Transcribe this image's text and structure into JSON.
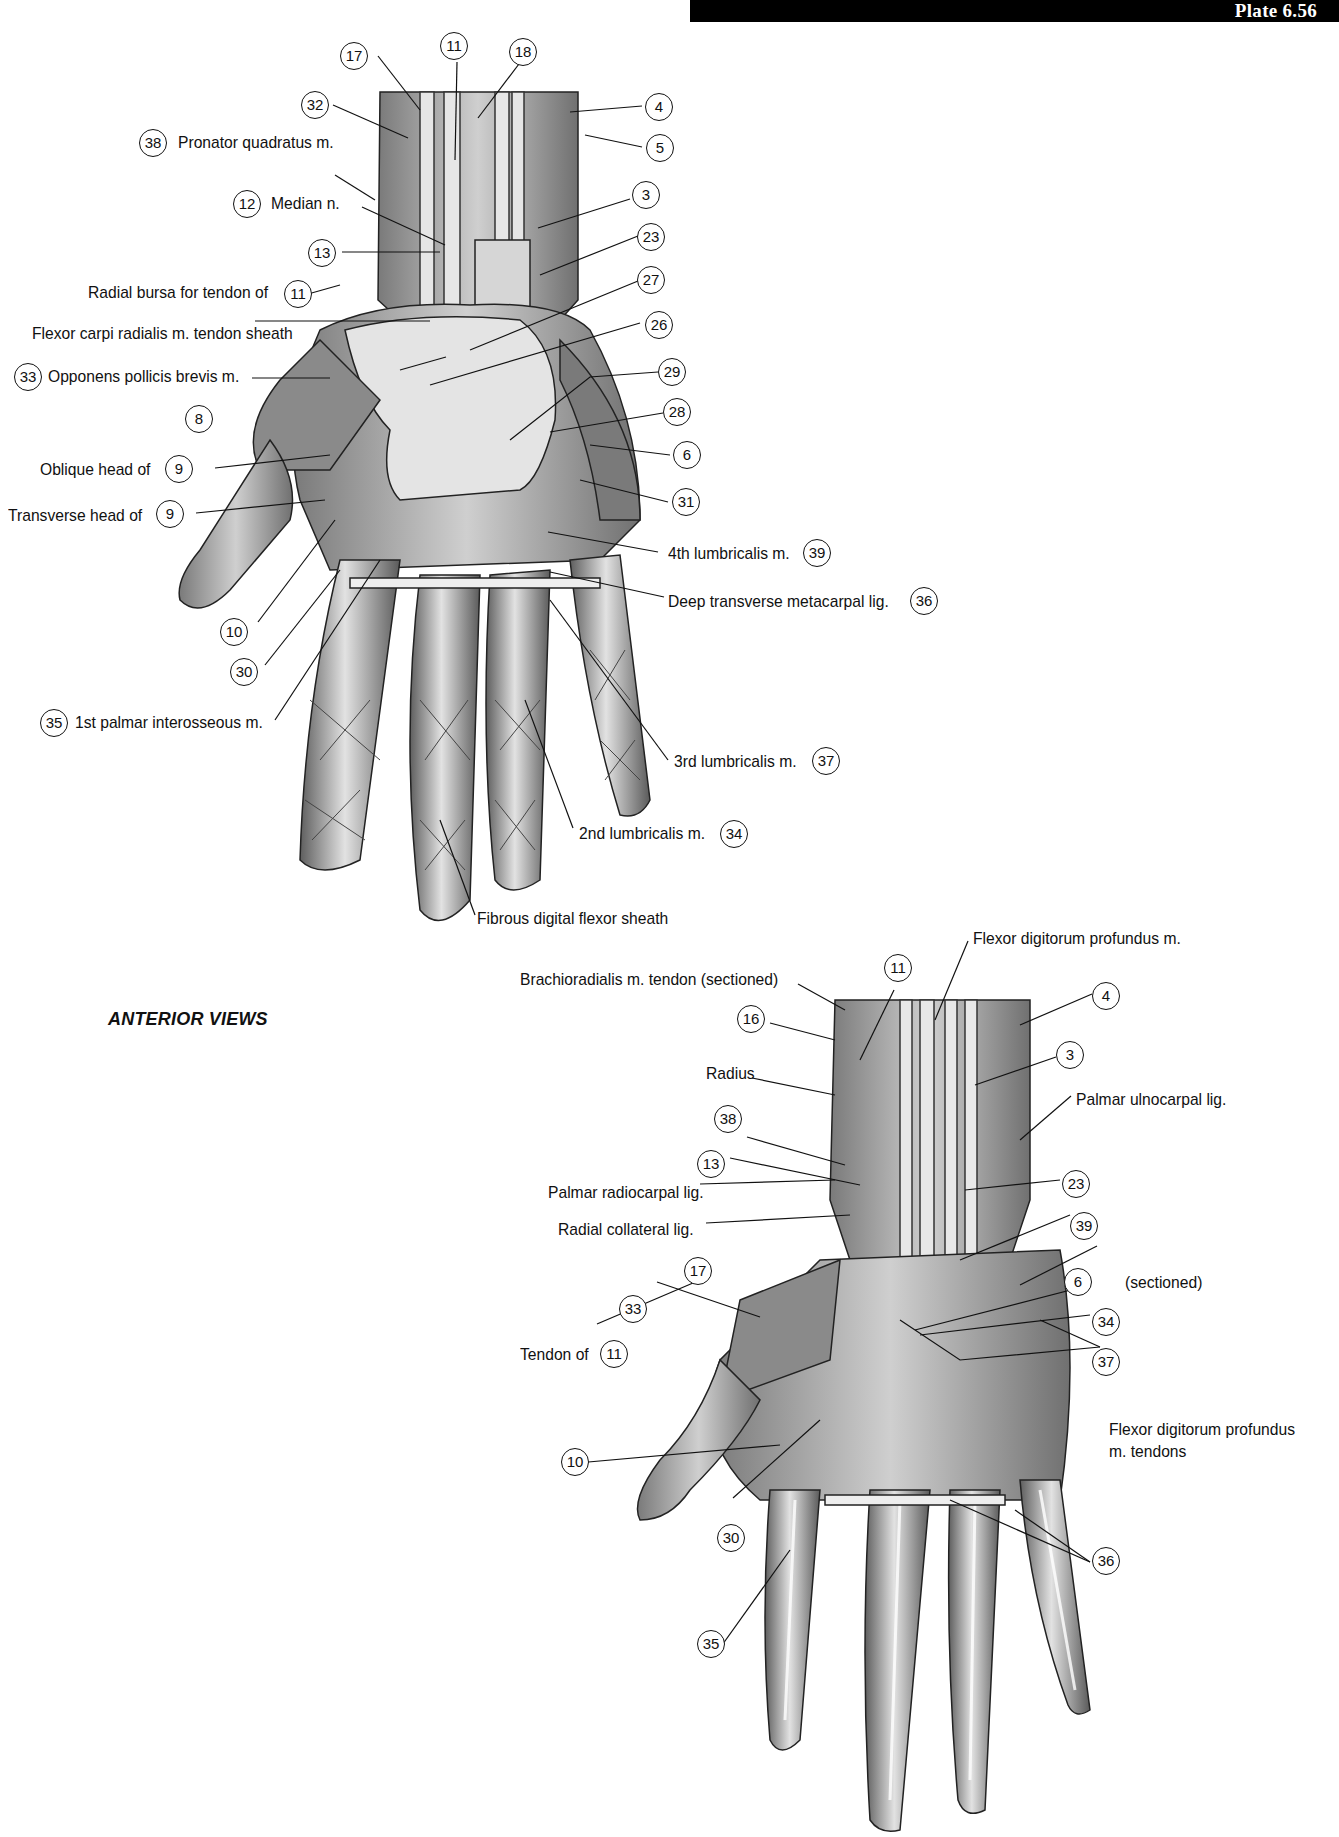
{
  "header": {
    "plate": "Plate 6.56"
  },
  "caption": "ANTERIOR VIEWS",
  "upper_view": {
    "callouts": [
      {
        "num": "17"
      },
      {
        "num": "11"
      },
      {
        "num": "18"
      },
      {
        "num": "32"
      },
      {
        "num": "4"
      },
      {
        "num": "5"
      },
      {
        "num": "3"
      },
      {
        "num": "23"
      },
      {
        "num": "27"
      },
      {
        "num": "26"
      },
      {
        "num": "29"
      },
      {
        "num": "28"
      },
      {
        "num": "6"
      },
      {
        "num": "31"
      },
      {
        "num": "8"
      },
      {
        "num": "10"
      },
      {
        "num": "30"
      }
    ],
    "labels": {
      "pronator_quadratus": {
        "num": "38",
        "text": "Pronator quadratus m."
      },
      "median_n": {
        "num": "12",
        "text": "Median n."
      },
      "radial_bursa": {
        "num": "11",
        "text": "Radial bursa for tendon of"
      },
      "fcr_sheath": {
        "text": "Flexor carpi radialis m. tendon sheath"
      },
      "opponens": {
        "num": "33",
        "text": "Opponens pollicis brevis m."
      },
      "oblique_head": {
        "num": "9",
        "text": "Oblique head of"
      },
      "transverse_head": {
        "num": "9",
        "text": "Transverse head of"
      },
      "first_palmar_interosseous": {
        "num": "35",
        "text": "1st palmar interosseous m."
      },
      "fourth_lumbricalis": {
        "num": "39",
        "text": "4th lumbricalis m."
      },
      "deep_transverse": {
        "num": "36",
        "text": "Deep transverse metacarpal lig."
      },
      "third_lumbricalis": {
        "num": "37",
        "text": "3rd lumbricalis m."
      },
      "second_lumbricalis": {
        "num": "34",
        "text": "2nd lumbricalis m."
      },
      "fibrous_sheath": {
        "text": "Fibrous digital flexor sheath"
      },
      "callout_13": {
        "num": "13"
      }
    }
  },
  "lower_view": {
    "labels": {
      "fdp_muscle": {
        "text": "Flexor digitorum profundus m."
      },
      "brachioradialis": {
        "text": "Brachioradialis m. tendon (sectioned)"
      },
      "radius": {
        "text": "Radius"
      },
      "palmar_ulnocarpal": {
        "text": "Palmar ulnocarpal lig."
      },
      "palmar_radiocarpal": {
        "text": "Palmar radiocarpal lig."
      },
      "radial_collateral": {
        "text": "Radial collateral lig."
      },
      "tendon_of": {
        "num": "11",
        "text": "Tendon of"
      },
      "sectioned_6": {
        "num": "6",
        "text": "(sectioned)"
      },
      "fdp_tendons": {
        "text": "Flexor digitorum profundus",
        "text2": "m. tendons"
      }
    },
    "callouts": [
      {
        "num": "11"
      },
      {
        "num": "16"
      },
      {
        "num": "4"
      },
      {
        "num": "3"
      },
      {
        "num": "38"
      },
      {
        "num": "13"
      },
      {
        "num": "23"
      },
      {
        "num": "39"
      },
      {
        "num": "17"
      },
      {
        "num": "33"
      },
      {
        "num": "34"
      },
      {
        "num": "37"
      },
      {
        "num": "10"
      },
      {
        "num": "30"
      },
      {
        "num": "36"
      },
      {
        "num": "35"
      }
    ]
  },
  "colors": {
    "ink": "#111111",
    "tissue_dark": "#6a6a6a",
    "tissue_mid": "#a8a8a8",
    "tissue_light": "#dcdcdc",
    "header_bg": "#000000"
  }
}
